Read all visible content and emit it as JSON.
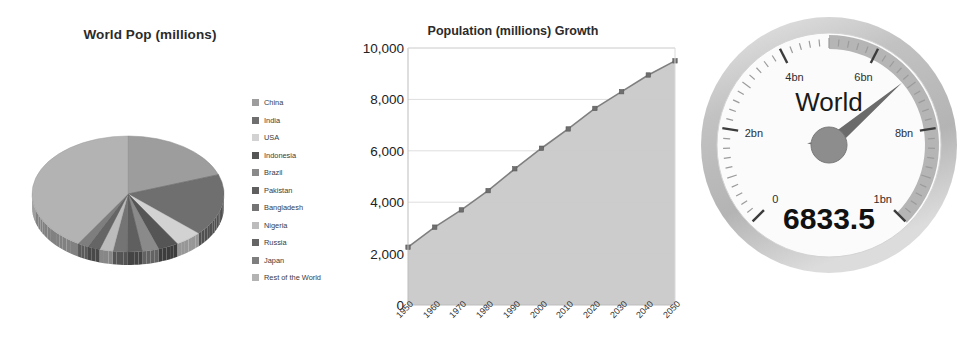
{
  "pie": {
    "title": "World Pop (millions)",
    "legend": [
      {
        "label": "China",
        "color": "#9d9d9d"
      },
      {
        "label": "India",
        "color": "#6f6f6f"
      },
      {
        "label": "USA",
        "color": "#d2d2d2"
      },
      {
        "label": "Indonesia",
        "color": "#555555"
      },
      {
        "label": "Brazil",
        "color": "#8a8a8a"
      },
      {
        "label": "Pakistan",
        "color": "#5f5f5f"
      },
      {
        "label": "Bangladesh",
        "color": "#747474"
      },
      {
        "label": "Nigeria",
        "color": "#bcbcbc"
      },
      {
        "label": "Russia",
        "color": "#656565"
      },
      {
        "label": "Japan",
        "color": "#7e7e7e"
      },
      {
        "label": "Rest of the World",
        "color": "#b3b3b3"
      }
    ]
  },
  "line": {
    "title": "Population (millions) Growth"
  },
  "gauge": {
    "caption": "World",
    "value_label": "6833.5",
    "value": 6833.5,
    "min": 0,
    "max": 10000,
    "tick_labels": [
      "0",
      "2bn",
      "4bn",
      "6bn",
      "8bn",
      "1bn"
    ],
    "band_color": "#a8a8a8",
    "needle_color": "#6b6b6b",
    "face_color": "#fbfbfb",
    "bezel_color": "#c6c6c6"
  },
  "chart_data": [
    {
      "type": "pie",
      "title": "World Pop (millions)",
      "legend_position": "right",
      "labels": [
        "China",
        "India",
        "USA",
        "Indonesia",
        "Brazil",
        "Pakistan",
        "Bangladesh",
        "Nigeria",
        "Russia",
        "Japan",
        "Rest of the World"
      ],
      "values": [
        1338,
        1182,
        310,
        232,
        193,
        170,
        164,
        154,
        142,
        127,
        2821
      ],
      "unit": "millions",
      "colors": [
        "#9d9d9d",
        "#6f6f6f",
        "#d2d2d2",
        "#555555",
        "#8a8a8a",
        "#5f5f5f",
        "#747474",
        "#bcbcbc",
        "#656565",
        "#7e7e7e",
        "#b3b3b3"
      ]
    },
    {
      "type": "area",
      "title": "Population (millions) Growth",
      "xlabel": "",
      "ylabel": "",
      "grid": true,
      "legend_position": "none",
      "categories": [
        "1950",
        "1960",
        "1970",
        "1980",
        "1990",
        "2000",
        "2010",
        "2020",
        "2030",
        "2040",
        "2050"
      ],
      "values": [
        2250,
        3030,
        3700,
        4450,
        5300,
        6100,
        6850,
        7650,
        8300,
        8950,
        9500
      ],
      "ylim": [
        0,
        10000
      ],
      "yticks": [
        0,
        2000,
        4000,
        6000,
        8000,
        10000
      ],
      "ytick_labels": [
        "0",
        "2,000",
        "4,000",
        "6,000",
        "8,000",
        "10,000"
      ],
      "line_color": "#7f7f7f",
      "fill_color": "#c9c9c9",
      "marker": "square"
    },
    {
      "type": "gauge",
      "title": "World",
      "value": 6833.5,
      "value_label": "6833.5",
      "min": 0,
      "max": 10000,
      "tick_labels": [
        "0",
        "2bn",
        "4bn",
        "6bn",
        "8bn",
        "1bn"
      ]
    }
  ]
}
